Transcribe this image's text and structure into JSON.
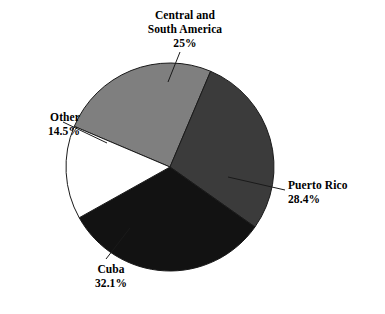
{
  "chart_data": {
    "type": "pie",
    "title": "",
    "subtitle": "",
    "xlabel": "",
    "ylabel": "",
    "legend_position": "none",
    "grid": false,
    "labels_outside": true,
    "leader_lines": true,
    "categories": [
      "Central and South America",
      "Puerto Rico",
      "Cuba",
      "Other"
    ],
    "values": [
      25,
      28.4,
      32.1,
      14.5
    ],
    "value_suffix": "%",
    "total": 100,
    "slices": [
      {
        "name": "Central and South America",
        "label_line1": "Central and",
        "label_line2": "South America",
        "value": 25,
        "value_text": "25%",
        "color": "#7f7f7f",
        "start_angle": 293,
        "end_angle": 383
      },
      {
        "name": "Puerto Rico",
        "label_line1": "Puerto Rico",
        "label_line2": "",
        "value": 28.4,
        "value_text": "28.4%",
        "color": "#3b3b3b",
        "start_angle": 383,
        "end_angle": 485.24
      },
      {
        "name": "Cuba",
        "label_line1": "Cuba",
        "label_line2": "",
        "value": 32.1,
        "value_text": "32.1%",
        "color": "#121212",
        "start_angle": 485.24,
        "end_angle": 600.8
      },
      {
        "name": "Other",
        "label_line1": "Other",
        "label_line2": "",
        "value": 14.5,
        "value_text": "14.5%",
        "color": "#ffffff",
        "start_angle": 600.8,
        "end_angle": 653
      }
    ],
    "colors": {
      "central_and_south_america": "#7f7f7f",
      "puerto_rico": "#3b3b3b",
      "cuba": "#121212",
      "other": "#ffffff",
      "outline": "#1a1a1a",
      "background": "#ffffff",
      "text": "#000000"
    }
  }
}
